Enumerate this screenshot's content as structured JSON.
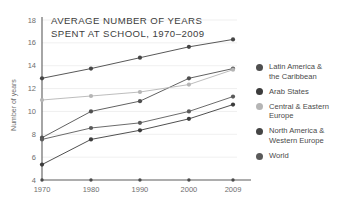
{
  "chart_data": {
    "type": "line",
    "title": "AVERAGE NUMBER OF YEARS\nSPENT AT SCHOOL, 1970–2009",
    "title_line1": "AVERAGE NUMBER OF YEARS",
    "title_line2": "SPENT AT SCHOOL, 1970–2009",
    "xlabel": "",
    "ylabel": "Number of years",
    "categories": [
      "1970",
      "1980",
      "1990",
      "2000",
      "2009"
    ],
    "x": [
      1970,
      1980,
      1990,
      2000,
      2009
    ],
    "ylim": [
      4,
      18
    ],
    "xlim": [
      1965,
      2013
    ],
    "yticks": [
      "4",
      "6",
      "8",
      "10",
      "12",
      "14",
      "16",
      "18"
    ],
    "ytick_values": [
      4,
      6,
      8,
      10,
      12,
      14,
      16,
      18
    ],
    "xticks": [
      "1970",
      "1980",
      "1990",
      "2000",
      "2009"
    ],
    "grid": true,
    "grid_axis": "y",
    "legend_position": "right",
    "series": [
      {
        "name": "Latin America &\nthe Caribbean",
        "name_flat": "Latin America & the Caribbean",
        "color": "#4f4f4f",
        "values": [
          7.7,
          10.0,
          10.9,
          12.9,
          13.75
        ]
      },
      {
        "name": "Arab States",
        "name_flat": "Arab States",
        "color": "#3c3c3c",
        "values": [
          5.35,
          7.55,
          8.35,
          9.35,
          10.6
        ]
      },
      {
        "name": "Central & Eastern\nEurope",
        "name_flat": "Central & Eastern Europe",
        "color": "#b5b5b5",
        "values": [
          11.0,
          11.35,
          11.7,
          12.35,
          13.65
        ]
      },
      {
        "name": "North America &\nWestern Europe",
        "name_flat": "North America & Western Europe",
        "color": "#454545",
        "values": [
          12.9,
          13.75,
          14.7,
          15.65,
          16.3
        ]
      },
      {
        "name": "World",
        "name_flat": "World",
        "color": "#5a5a5a",
        "values": [
          7.55,
          8.55,
          9.0,
          10.0,
          11.3
        ]
      }
    ]
  },
  "colors": {
    "background": "#ffffff",
    "axis": "#5c5c5c",
    "grid": "#e8e8e8",
    "text": "#4a4a4a",
    "title": "#3d3d3d",
    "light_series": "#b5b5b5",
    "dark_series": "#454545"
  }
}
